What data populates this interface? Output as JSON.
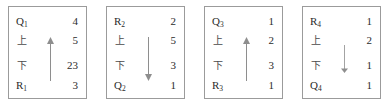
{
  "figure": {
    "type": "diagram",
    "line_color": "#9b9b9b",
    "text_color": "#2b2b2b",
    "panels": [
      {
        "id": "panel-1",
        "arrow": {
          "direction": "up",
          "length": "long",
          "glyph": "arrow-up-icon"
        },
        "rows": [
          {
            "label": "Q",
            "sub": "1",
            "kind": "latin",
            "value": "4"
          },
          {
            "label": "上",
            "sub": "",
            "kind": "cjk",
            "value": "5"
          },
          {
            "label": "下",
            "sub": "",
            "kind": "cjk",
            "value": "23"
          },
          {
            "label": "R",
            "sub": "1",
            "kind": "latin",
            "value": "3"
          }
        ]
      },
      {
        "id": "panel-2",
        "arrow": {
          "direction": "down",
          "length": "long",
          "glyph": "arrow-down-icon"
        },
        "rows": [
          {
            "label": "R",
            "sub": "2",
            "kind": "latin",
            "value": "2"
          },
          {
            "label": "上",
            "sub": "",
            "kind": "cjk",
            "value": "5"
          },
          {
            "label": "下",
            "sub": "",
            "kind": "cjk",
            "value": "3"
          },
          {
            "label": "Q",
            "sub": "2",
            "kind": "latin",
            "value": "1"
          }
        ]
      },
      {
        "id": "panel-3",
        "arrow": {
          "direction": "up",
          "length": "long",
          "glyph": "arrow-up-icon"
        },
        "rows": [
          {
            "label": "Q",
            "sub": "3",
            "kind": "latin",
            "value": "1"
          },
          {
            "label": "上",
            "sub": "",
            "kind": "cjk",
            "value": "2"
          },
          {
            "label": "下",
            "sub": "",
            "kind": "cjk",
            "value": "3"
          },
          {
            "label": "R",
            "sub": "3",
            "kind": "latin",
            "value": "1"
          }
        ]
      },
      {
        "id": "panel-4",
        "arrow": {
          "direction": "down",
          "length": "short",
          "glyph": "arrow-down-icon"
        },
        "rows": [
          {
            "label": "R",
            "sub": "4",
            "kind": "latin",
            "value": "1"
          },
          {
            "label": "上",
            "sub": "",
            "kind": "cjk",
            "value": "2"
          },
          {
            "label": "下",
            "sub": "",
            "kind": "cjk",
            "value": "1"
          },
          {
            "label": "Q",
            "sub": "4",
            "kind": "latin",
            "value": "1"
          }
        ]
      }
    ]
  }
}
